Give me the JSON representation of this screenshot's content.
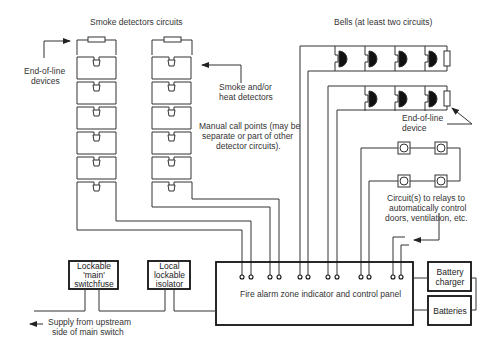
{
  "titles": {
    "smoke": "Smoke detectors circuits",
    "bells": "Bells (at least two circuits)"
  },
  "annotations": {
    "eol_devices_1": "End-of-line",
    "eol_devices_2": "devices",
    "smoke_heat_1": "Smoke and/or",
    "smoke_heat_2": "heat detectors",
    "mcp_1": "Manual call points (may be",
    "mcp_2": "separate or part of other",
    "mcp_3": "detector circuits).",
    "eol_device_1": "End-of-line",
    "eol_device_2": "device",
    "relays_1": "Circuit(s) to relays to",
    "relays_2": "automatically control",
    "relays_3": "doors, ventilation, etc.",
    "supply_1": "Supply from upstream",
    "supply_2": "side of main switch"
  },
  "boxes": {
    "panel": "Fire alarm zone indicator and control panel",
    "switchfuse_1": "Lockable",
    "switchfuse_2": "'main'",
    "switchfuse_3": "switchfuse",
    "isolator_1": "Local",
    "isolator_2": "lockable",
    "isolator_3": "isolator",
    "charger_1": "Battery",
    "charger_2": "charger",
    "batteries": "Batteries"
  },
  "components": {
    "smoke_circuits": 2,
    "detectors_per_circuit": 6,
    "bell_circuits": 2,
    "bells_circuit_1": 4,
    "bells_circuit_2": 3,
    "relay_devices": 4,
    "panel_terminal_pairs": 6
  },
  "colors": {
    "line": "#333333",
    "background": "#ffffff",
    "bell_fill": "#111111"
  }
}
